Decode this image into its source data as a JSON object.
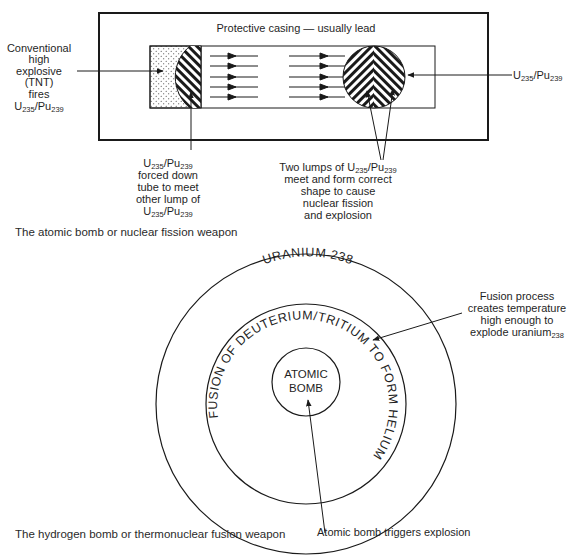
{
  "colors": {
    "ink": "#1f1f1f",
    "background": "#ffffff"
  },
  "fission": {
    "casing_label": "Protective casing — usually lead",
    "left_label": {
      "lines": [
        "Conventional",
        "high",
        "explosive",
        "(TNT)",
        "fires"
      ],
      "formula": {
        "a": "U",
        "a_sub": "235",
        "sep": "/Pu",
        "b_sub": "239"
      }
    },
    "right_label": {
      "a": "U",
      "a_sub": "235",
      "sep": "/Pu",
      "b_sub": "239"
    },
    "bottom_left_label": {
      "formula_top": {
        "a": "U",
        "a_sub": "235",
        "sep": "/Pu",
        "b_sub": "239"
      },
      "lines": [
        "forced down",
        "tube to meet",
        "other lump of"
      ],
      "formula_bottom": {
        "a": "U",
        "a_sub": "235",
        "sep": "/Pu",
        "b_sub": "239"
      }
    },
    "bottom_right_label": {
      "first_line_prefix": "Two lumps of ",
      "formula": {
        "a": "U",
        "a_sub": "235",
        "sep": "/Pu",
        "b_sub": "239"
      },
      "lines": [
        "meet and form correct",
        "shape to cause",
        "nuclear fission",
        "and explosion"
      ]
    },
    "caption": "The atomic bomb or nuclear fission weapon"
  },
  "fusion": {
    "outer_ring_label": "URANIUM 238",
    "middle_ring_label": "FUSION OF DEUTERIUM/TRITIUM TO FORM HELIUM",
    "core_label": [
      "ATOMIC",
      "BOMB"
    ],
    "right_label": {
      "lines": [
        "Fusion process",
        "creates temperature",
        "high enough to"
      ],
      "last_line": "explode uranium",
      "last_sub": "238"
    },
    "bottom_label": "Atomic bomb triggers explosion",
    "caption": "The hydrogen bomb or thermonuclear fusion weapon"
  }
}
